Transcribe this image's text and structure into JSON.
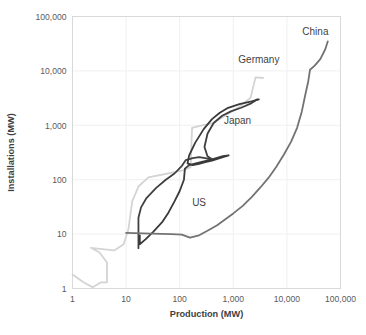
{
  "chart_data": {
    "type": "line",
    "title": "",
    "xlabel": "Production (MW)",
    "ylabel": "Installations (MW)",
    "xscale": "log",
    "yscale": "log",
    "xlim": [
      1,
      100000
    ],
    "ylim": [
      1,
      100000
    ],
    "xticks": [
      "1",
      "10",
      "100",
      "1,000",
      "10,000",
      "100,000"
    ],
    "xtick_values": [
      1,
      10,
      100,
      1000,
      10000,
      100000
    ],
    "yticks": [
      "1",
      "10",
      "100",
      "1,000",
      "10,000",
      "100,000"
    ],
    "ytick_values": [
      1,
      10,
      100,
      1000,
      10000,
      100000
    ],
    "grid": true,
    "legend_position": "inline-annotations",
    "series": [
      {
        "name": "Germany",
        "color": "#d4d4d4",
        "label": "Germany",
        "label_x": 3000,
        "label_y": 14000,
        "points": [
          [
            1.0,
            1.8
          ],
          [
            1.6,
            1.3
          ],
          [
            2.4,
            1.05
          ],
          [
            3.4,
            1.3
          ],
          [
            4.4,
            1.3
          ],
          [
            4.4,
            3.0
          ],
          [
            3.2,
            4.6
          ],
          [
            2.2,
            5.6
          ],
          [
            3.6,
            5.3
          ],
          [
            6.0,
            5.0
          ],
          [
            9.0,
            6.5
          ],
          [
            11.0,
            12.0
          ],
          [
            13.0,
            40.0
          ],
          [
            17.0,
            75.0
          ],
          [
            26.0,
            110.0
          ],
          [
            60.0,
            130.0
          ],
          [
            120.0,
            150.0
          ],
          [
            160.0,
            170.0
          ],
          [
            170.0,
            900.0
          ],
          [
            260.0,
            1000.0
          ],
          [
            420.0,
            1100.0
          ],
          [
            700.0,
            1500.0
          ],
          [
            1300.0,
            2200.0
          ],
          [
            2100.0,
            3200.0
          ],
          [
            2600.0,
            7600.0
          ],
          [
            3600.0,
            7400.0
          ]
        ]
      },
      {
        "name": "Japan",
        "color": "#404040",
        "label": "Japan",
        "label_x": 1200,
        "label_y": 1050,
        "points": [
          [
            17.0,
            5.5
          ],
          [
            17.0,
            20.0
          ],
          [
            19.0,
            31.0
          ],
          [
            24.0,
            46.0
          ],
          [
            36.0,
            70.0
          ],
          [
            55.0,
            100.0
          ],
          [
            80.0,
            130.0
          ],
          [
            110.0,
            180.0
          ],
          [
            130.0,
            230.0
          ],
          [
            175.0,
            250.0
          ],
          [
            230.0,
            260.0
          ],
          [
            300.0,
            250.0
          ],
          [
            420.0,
            230.0
          ],
          [
            330.0,
            270.0
          ],
          [
            290.0,
            400.0
          ],
          [
            330.0,
            700.0
          ],
          [
            430.0,
            1100.0
          ],
          [
            620.0,
            1500.0
          ],
          [
            900.0,
            1800.0
          ],
          [
            1400.0,
            2100.0
          ],
          [
            2100.0,
            2500.0
          ],
          [
            2800.0,
            3000.0
          ]
        ]
      },
      {
        "name": "US",
        "color": "#3a3a3a",
        "label": "US",
        "label_x": 230,
        "label_y": 33,
        "points": [
          [
            18.0,
            9.5
          ],
          [
            18.0,
            6.5
          ],
          [
            23.0,
            8.0
          ],
          [
            32.0,
            11.0
          ],
          [
            48.0,
            17.0
          ],
          [
            62.0,
            25.0
          ],
          [
            80.0,
            40.0
          ],
          [
            100.0,
            62.0
          ],
          [
            120.0,
            100.0
          ],
          [
            125.0,
            160.0
          ],
          [
            150.0,
            185.0
          ],
          [
            200.0,
            200.0
          ],
          [
            270.0,
            215.0
          ],
          [
            360.0,
            230.0
          ],
          [
            480.0,
            250.0
          ],
          [
            640.0,
            270.0
          ],
          [
            820.0,
            280.0
          ],
          [
            560.0,
            250.0
          ],
          [
            400.0,
            225.0
          ],
          [
            300.0,
            210.0
          ],
          [
            230.0,
            195.0
          ],
          [
            175.0,
            185.0
          ],
          [
            140.0,
            200.0
          ],
          [
            150.0,
            280.0
          ],
          [
            195.0,
            480.0
          ],
          [
            280.0,
            850.0
          ],
          [
            400.0,
            1300.0
          ],
          [
            560.0,
            1700.0
          ],
          [
            800.0,
            2100.0
          ],
          [
            1300.0,
            2450.0
          ],
          [
            2200.0,
            2750.0
          ],
          [
            3000.0,
            3000.0
          ]
        ]
      },
      {
        "name": "China",
        "color": "#737373",
        "label": "China",
        "label_x": 34000,
        "label_y": 46000,
        "points": [
          [
            10.0,
            10.5
          ],
          [
            30.0,
            10.2
          ],
          [
            70.0,
            10.0
          ],
          [
            110.0,
            9.8
          ],
          [
            155.0,
            8.6
          ],
          [
            230.0,
            9.5
          ],
          [
            330.0,
            11.5
          ],
          [
            500.0,
            14.5
          ],
          [
            700.0,
            18.5
          ],
          [
            1000.0,
            24.0
          ],
          [
            1500.0,
            33.0
          ],
          [
            2200.0,
            48.0
          ],
          [
            3200.0,
            72.0
          ],
          [
            4600.0,
            110.0
          ],
          [
            6400.0,
            175.0
          ],
          [
            8800.0,
            290.0
          ],
          [
            12000.0,
            500.0
          ],
          [
            15500.0,
            900.0
          ],
          [
            19000.0,
            1800.0
          ],
          [
            22000.0,
            3600.0
          ],
          [
            25000.0,
            6400.0
          ],
          [
            27000.0,
            10500.0
          ],
          [
            33000.0,
            12500.0
          ],
          [
            42000.0,
            16500.0
          ],
          [
            52000.0,
            25000.0
          ],
          [
            58000.0,
            35000.0
          ]
        ]
      }
    ]
  },
  "axes": {
    "x_title": "Production (MW)",
    "y_title": "Installations (MW)"
  }
}
